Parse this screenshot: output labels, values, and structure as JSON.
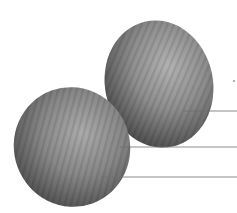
{
  "figure": {
    "background": "#ffffff",
    "objects": [
      {
        "id": "ellipsoid-right",
        "name": "Upper right ellipsoid",
        "center": [
          159,
          84
        ],
        "rx": 54,
        "ry": 64,
        "rotation": -12,
        "fill_light": "#a9a9a9",
        "fill_dark": "#4a4a4a"
      },
      {
        "id": "ellipsoid-left",
        "name": "Lower left ellipsoid",
        "center": [
          72,
          147
        ],
        "rx": 58,
        "ry": 60,
        "rotation": -20,
        "fill_light": "#a3a3a3",
        "fill_dark": "#454545"
      }
    ],
    "leader_lines": [
      {
        "id": "leader-1",
        "x1": 183,
        "y1": 111,
        "x2": 237,
        "y2": 111,
        "color": "#7a7a7a",
        "label": ""
      },
      {
        "id": "leader-2",
        "x1": 120,
        "y1": 147,
        "x2": 237,
        "y2": 147,
        "color": "#7a7a7a",
        "label": ""
      },
      {
        "id": "leader-3",
        "x1": 101,
        "y1": 177,
        "x2": 237,
        "y2": 177,
        "color": "#7a7a7a",
        "label": ""
      }
    ],
    "marker": {
      "x": 234,
      "y": 81,
      "color": "#8a8a8a"
    }
  }
}
